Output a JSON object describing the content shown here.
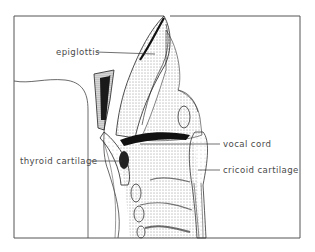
{
  "diagram": {
    "labels": [
      {
        "id": "epiglottis",
        "text": "epiglottis",
        "x": 56,
        "y": 47,
        "leader": {
          "x1": 96,
          "y1": 52,
          "x2": 155,
          "y2": 54
        }
      },
      {
        "id": "vocal-cord",
        "text": "vocal cord",
        "x": 223,
        "y": 139,
        "leader": {
          "x1": 140,
          "y1": 144,
          "x2": 220,
          "y2": 144
        }
      },
      {
        "id": "cricoid-cartilage",
        "text": "cricoid cartilage",
        "x": 223,
        "y": 165,
        "leader": {
          "x1": 198,
          "y1": 170,
          "x2": 220,
          "y2": 170
        }
      },
      {
        "id": "thyroid-cartilage",
        "text": "thyroid cartilage",
        "x": 20,
        "y": 156,
        "leader": {
          "x1": 91,
          "y1": 161,
          "x2": 122,
          "y2": 161
        }
      }
    ],
    "colors": {
      "frame": "#555555",
      "ink": "#1a1a1a",
      "label_text": "#4a4a4a",
      "background": "#ffffff"
    }
  }
}
